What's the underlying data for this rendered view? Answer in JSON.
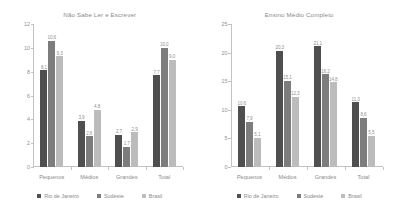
{
  "chart_data": [
    {
      "type": "bar",
      "title": "Não Sabe Ler e Escrever",
      "xlabel": "",
      "ylabel": "",
      "ylim": [
        0,
        12
      ],
      "yticks": [
        "0",
        "2",
        "4",
        "6",
        "8",
        "10",
        "12"
      ],
      "grid": false,
      "legend_position": "bottom",
      "categories": [
        "Pequenos",
        "Médios",
        "Grandes",
        "Total"
      ],
      "series": [
        {
          "name": "Rio de Janeiro",
          "color": "#4f4f4f",
          "values": [
            8.1,
            3.9,
            2.7,
            7.7
          ]
        },
        {
          "name": "Sudeste",
          "color": "#7d7d7d",
          "values": [
            10.6,
            2.6,
            1.7,
            10.0
          ]
        },
        {
          "name": "Brasil",
          "color": "#bcbcbc",
          "values": [
            9.3,
            4.8,
            2.9,
            9.0
          ]
        }
      ],
      "labels": [
        [
          "8,1",
          "3,9",
          "2,7",
          "7,7"
        ],
        [
          "10,6",
          "2,6",
          "1,7",
          "10,0"
        ],
        [
          "9,3",
          "4,8",
          "2,9",
          "9,0"
        ]
      ]
    },
    {
      "type": "bar",
      "title": "Ensino Médio Completo",
      "xlabel": "",
      "ylabel": "",
      "ylim": [
        0,
        25
      ],
      "yticks": [
        "0",
        "5",
        "10",
        "15",
        "20",
        "25"
      ],
      "grid": false,
      "legend_position": "bottom",
      "categories": [
        "Pequenos",
        "Médios",
        "Grandes",
        "Total"
      ],
      "series": [
        {
          "name": "Rio de Janeiro",
          "color": "#4f4f4f",
          "values": [
            10.6,
            20.3,
            21.1,
            11.3
          ]
        },
        {
          "name": "Sudeste",
          "color": "#7d7d7d",
          "values": [
            7.9,
            15.1,
            16.2,
            8.6
          ]
        },
        {
          "name": "Brasil",
          "color": "#bcbcbc",
          "values": [
            5.1,
            12.3,
            14.8,
            5.5
          ]
        }
      ],
      "labels": [
        [
          "10,6",
          "20,3",
          "21,1",
          "11,3"
        ],
        [
          "7,9",
          "15,1",
          "16,2",
          "8,6"
        ],
        [
          "5,1",
          "12,3",
          "14,8",
          "5,5"
        ]
      ]
    }
  ]
}
